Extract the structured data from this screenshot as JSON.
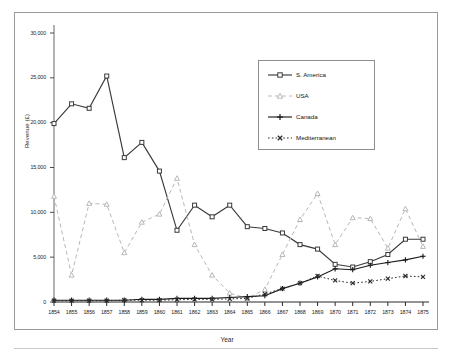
{
  "chart_data": {
    "type": "line",
    "title": "",
    "xlabel": "Year",
    "ylabel": "Revenue (£)",
    "xlim": [
      1854,
      1875
    ],
    "ylim": [
      0,
      30000
    ],
    "ytick_step": 5000,
    "grid": false,
    "legend_position": "top-right",
    "categories": [
      "1854",
      "1855",
      "1856",
      "1857",
      "1858",
      "1859",
      "1860",
      "1861",
      "1862",
      "1863",
      "1864",
      "1865",
      "1866",
      "1867",
      "1868",
      "1869",
      "1870",
      "1871",
      "1872",
      "1873",
      "1874",
      "1875"
    ],
    "yticks": [
      "0",
      "5,000",
      "10,000",
      "15,000",
      "20,000",
      "25,000",
      "30,000"
    ],
    "series": [
      {
        "name": "S. America",
        "color": "#3a3a3a",
        "marker": "square",
        "dash": "solid",
        "values": [
          19900,
          22100,
          21600,
          25200,
          16100,
          17800,
          14600,
          8000,
          10800,
          9500,
          10800,
          8400,
          8200,
          7700,
          6400,
          5900,
          4200,
          3900,
          4500,
          5300,
          7000,
          7000
        ]
      },
      {
        "name": "USA",
        "color": "#b8b8b8",
        "marker": "triangle",
        "dash": "dashed",
        "values": [
          11800,
          3000,
          11000,
          10900,
          5500,
          8900,
          9800,
          13800,
          6400,
          3000,
          1000,
          400,
          1400,
          5300,
          9200,
          12100,
          6400,
          9400,
          9300,
          6000,
          10400,
          6200
        ]
      },
      {
        "name": "Canada",
        "color": "#1a1a1a",
        "marker": "plus",
        "dash": "solid",
        "values": [
          200,
          200,
          200,
          200,
          200,
          300,
          300,
          400,
          400,
          400,
          500,
          600,
          700,
          1500,
          2100,
          2800,
          3700,
          3600,
          4100,
          4400,
          4700,
          5100
        ]
      },
      {
        "name": "Mediterranean",
        "color": "#2a2a2a",
        "marker": "x",
        "dash": "dotted",
        "values": [
          150,
          150,
          150,
          150,
          200,
          200,
          200,
          250,
          300,
          300,
          350,
          400,
          900,
          1500,
          2100,
          2900,
          2400,
          2100,
          2300,
          2600,
          2900,
          2800
        ]
      }
    ]
  }
}
